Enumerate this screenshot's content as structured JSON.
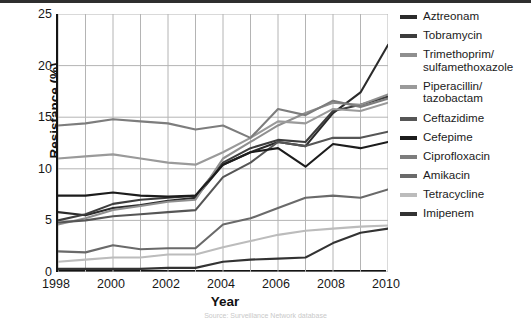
{
  "axis": {
    "y_label": "Resistance (%)",
    "x_label": "Year",
    "yticks": [
      "25",
      "20",
      "15",
      "10",
      "5",
      "0"
    ],
    "xticks": [
      "1998",
      "2000",
      "2002",
      "2004",
      "2006",
      "2008",
      "2010"
    ]
  },
  "caption": {
    "text": "Source: Surveillance Network database"
  },
  "legend": {
    "items": [
      {
        "label": "Aztreonam",
        "label2": "",
        "color": "#2b2b2b"
      },
      {
        "label": "Tobramycin",
        "label2": "",
        "color": "#3d3d3d"
      },
      {
        "label": "Trimethoprim/",
        "label2": "sulfamethoxazole",
        "color": "#8f8f8f"
      },
      {
        "label": "Piperacillin/",
        "label2": "tazobactam",
        "color": "#9a9a9a"
      },
      {
        "label": "Ceftazidime",
        "label2": "",
        "color": "#565656"
      },
      {
        "label": "Cefepime",
        "label2": "",
        "color": "#1c1c1c"
      },
      {
        "label": "Ciprofloxacin",
        "label2": "",
        "color": "#7d7d7d"
      },
      {
        "label": "Amikacin",
        "label2": "",
        "color": "#6a6a6a"
      },
      {
        "label": "Tetracycline",
        "label2": "",
        "color": "#bcbcbc"
      },
      {
        "label": "Imipenem",
        "label2": "",
        "color": "#333333"
      }
    ]
  },
  "chart_data": {
    "type": "line",
    "title": "",
    "xlabel": "Year",
    "ylabel": "Resistance (%)",
    "xlim": [
      1998,
      2010
    ],
    "ylim": [
      0,
      25
    ],
    "grid": true,
    "legend_position": "right",
    "x": [
      1998,
      1999,
      2000,
      2001,
      2002,
      2003,
      2004,
      2005,
      2006,
      2007,
      2008,
      2009,
      2010
    ],
    "series": [
      {
        "name": "Aztreonam",
        "color": "#2b2b2b",
        "values": [
          5.8,
          5.5,
          6.2,
          6.5,
          6.9,
          7.2,
          10.4,
          11.6,
          12.6,
          12.2,
          15.4,
          17.4,
          22.0
        ]
      },
      {
        "name": "Tobramycin",
        "color": "#3d3d3d",
        "values": [
          5.0,
          5.6,
          6.6,
          7.0,
          7.2,
          7.4,
          10.6,
          12.0,
          12.8,
          12.6,
          15.6,
          16.2,
          17.0
        ]
      },
      {
        "name": "Trimethoprim/sulfamethoxazole",
        "color": "#8f8f8f",
        "values": [
          4.6,
          5.2,
          6.0,
          6.4,
          6.8,
          7.0,
          11.0,
          12.6,
          14.2,
          15.4,
          16.4,
          16.2,
          17.2
        ]
      },
      {
        "name": "Piperacillin/tazobactam",
        "color": "#9a9a9a",
        "values": [
          11.0,
          11.2,
          11.4,
          11.0,
          10.6,
          10.4,
          11.6,
          13.0,
          14.6,
          14.4,
          15.8,
          15.6,
          16.4
        ]
      },
      {
        "name": "Ceftazidime",
        "color": "#565656",
        "values": [
          4.8,
          5.0,
          5.4,
          5.6,
          5.8,
          6.0,
          9.2,
          10.6,
          12.6,
          12.2,
          13.0,
          13.0,
          13.6
        ]
      },
      {
        "name": "Cefepime",
        "color": "#1c1c1c",
        "values": [
          7.4,
          7.4,
          7.7,
          7.4,
          7.3,
          7.4,
          10.4,
          11.6,
          12.0,
          10.2,
          12.4,
          12.0,
          12.6
        ]
      },
      {
        "name": "Ciprofloxacin",
        "color": "#7d7d7d",
        "values": [
          14.2,
          14.4,
          14.8,
          14.6,
          14.4,
          13.8,
          14.2,
          13.0,
          15.8,
          15.2,
          16.6,
          16.0,
          16.8
        ]
      },
      {
        "name": "Amikacin",
        "color": "#6a6a6a",
        "values": [
          2.0,
          1.9,
          2.6,
          2.2,
          2.3,
          2.3,
          4.6,
          5.2,
          6.2,
          7.2,
          7.4,
          7.2,
          8.0
        ]
      },
      {
        "name": "Tetracycline",
        "color": "#bcbcbc",
        "values": [
          1.0,
          1.2,
          1.4,
          1.4,
          1.7,
          1.7,
          2.4,
          3.0,
          3.6,
          4.0,
          4.2,
          4.4,
          4.5
        ]
      },
      {
        "name": "Imipenem",
        "color": "#333333",
        "values": [
          0.3,
          0.3,
          0.3,
          0.3,
          0.4,
          0.4,
          1.0,
          1.2,
          1.3,
          1.4,
          2.8,
          3.8,
          4.2
        ]
      }
    ]
  }
}
